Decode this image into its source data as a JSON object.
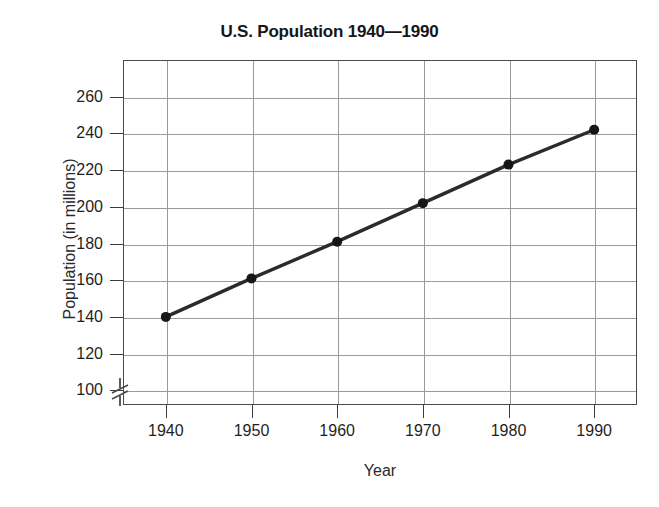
{
  "chart_data": {
    "type": "line",
    "title": "U.S. Population 1940—1990",
    "xlabel": "Year",
    "ylabel": "Population (in millions)",
    "x": [
      1940,
      1950,
      1960,
      1970,
      1980,
      1990
    ],
    "values": [
      140,
      161,
      181,
      202,
      223,
      242
    ],
    "categories": [
      "1940",
      "1950",
      "1960",
      "1970",
      "1980",
      "1990"
    ],
    "xtick_labels": [
      "1940",
      "1950",
      "1960",
      "1970",
      "1980",
      "1990"
    ],
    "ytick_labels": [
      "100",
      "120",
      "140",
      "160",
      "180",
      "200",
      "220",
      "240",
      "260"
    ],
    "ytick_values": [
      100,
      120,
      140,
      160,
      180,
      200,
      220,
      240,
      260
    ],
    "xlim": [
      1935,
      1995
    ],
    "ylim": [
      92,
      280
    ],
    "grid": true,
    "legend": null,
    "legend_position": "none",
    "axis_break": {
      "axis": "y",
      "below_value": 100,
      "symbol": "zigzag"
    },
    "series": [
      {
        "name": "U.S. Population",
        "values": [
          140,
          161,
          181,
          202,
          223,
          242
        ],
        "marker": "filled-circle",
        "line_color": "#2b2b2b",
        "marker_color": "#161616"
      }
    ],
    "colors": {
      "line": "#2b2b2b",
      "marker": "#161616",
      "grid": "#9a9a9a",
      "frame": "#4a4a4a",
      "text": "#1a1a1a",
      "background": "#ffffff"
    }
  }
}
